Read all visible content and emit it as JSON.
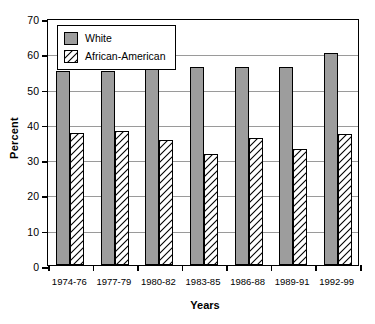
{
  "chart_data": {
    "type": "bar",
    "title": "",
    "xlabel": "Years",
    "ylabel": "Percent",
    "ylim": [
      0,
      70
    ],
    "ytick_step": 10,
    "yticks": [
      0,
      10,
      20,
      30,
      40,
      50,
      60,
      70
    ],
    "grid": "horizontal",
    "legend_position": "top-left-inside",
    "categories": [
      "1974-76",
      "1977-79",
      "1980-82",
      "1983-85",
      "1986-88",
      "1989-91",
      "1992-99"
    ],
    "series": [
      {
        "name": "White",
        "color": "#9d9d9d",
        "fill": "solid",
        "values": [
          55,
          55,
          56,
          56,
          56,
          56,
          60
        ]
      },
      {
        "name": "African-American",
        "color": "#ffffff",
        "fill": "diagonal-hatch",
        "values": [
          37.5,
          38,
          35.5,
          31.5,
          36,
          33,
          37
        ]
      }
    ]
  },
  "axes": {
    "y_title": "Percent",
    "x_title": "Years"
  },
  "legend": {
    "entries": [
      {
        "label": "White",
        "swatch": "solid-gray-swatch"
      },
      {
        "label": "African-American",
        "swatch": "hatched-swatch"
      }
    ]
  },
  "colors": {
    "bar_white_series": "#9d9d9d",
    "bar_aa_series": "#ffffff",
    "axis": "#000000",
    "gridline": "#9a9a9a",
    "background": "#ffffff"
  }
}
